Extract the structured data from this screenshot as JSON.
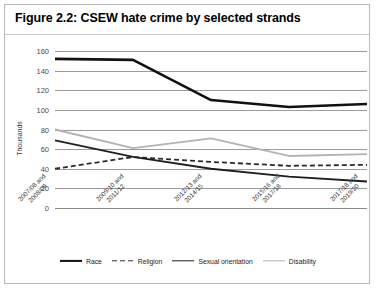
{
  "figure": {
    "title": "Figure 2.2: CSEW hate crime by selected strands"
  },
  "chart_data": {
    "type": "line",
    "title": "Figure 2.2: CSEW hate crime by selected strands",
    "xlabel": "",
    "ylabel": "Thousands",
    "ylim": [
      0,
      160
    ],
    "ytick_step": 20,
    "yticks": [
      160,
      140,
      120,
      100,
      80,
      60,
      40,
      20,
      0
    ],
    "grid": true,
    "legend_position": "bottom",
    "categories": [
      "2007/08 and 2008/09",
      "2009/10 and 2011/12",
      "2012/13 and 2014/15",
      "2015/16 and 2017/18",
      "2017/18 and 2019/20"
    ],
    "categories_lines": [
      [
        "2007/08 and",
        "2008/09"
      ],
      [
        "2009/10 and",
        "2011/12"
      ],
      [
        "2012/13 and",
        "2014/15"
      ],
      [
        "2015/16 and",
        "2017/18"
      ],
      [
        "2017/18 and",
        "2019/20"
      ]
    ],
    "series": [
      {
        "name": "Race",
        "color": "#111111",
        "style": "solid",
        "width": 2.6,
        "values": [
          152,
          151,
          110,
          103,
          106
        ]
      },
      {
        "name": "Religion",
        "color": "#2b2b2b",
        "style": "dashed",
        "width": 1.8,
        "values": [
          40,
          52,
          47,
          43,
          44
        ]
      },
      {
        "name": "Sexual orientation",
        "color": "#1f1f1f",
        "style": "solid",
        "width": 1.8,
        "values": [
          69,
          52,
          40,
          32,
          27
        ]
      },
      {
        "name": "Disability",
        "color": "#b3b3b3",
        "style": "solid",
        "width": 1.8,
        "values": [
          80,
          61,
          71,
          53,
          55
        ]
      }
    ]
  }
}
